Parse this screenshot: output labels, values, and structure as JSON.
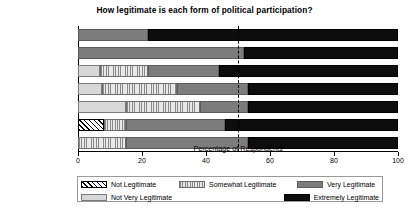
{
  "chart_data": {
    "type": "bar",
    "orientation": "horizontal",
    "stacked": true,
    "title": "How legitimate is each form of political participation?",
    "xlabel": "Percentage of Respondents",
    "ylabel": "",
    "xlim": [
      0,
      100
    ],
    "xticks": [
      0,
      20,
      40,
      60,
      80,
      100
    ],
    "grid": false,
    "legend_position": "bottom",
    "reference_line": {
      "value": 50,
      "style": "dashed",
      "color": "#000000"
    },
    "categories": [
      "Voting",
      "Volunteering",
      "Contacting Elected Officials",
      "Protesting",
      "Lobbying",
      "Running for Office",
      "Voicing Opinions"
    ],
    "category_lines": [
      [
        "Voting"
      ],
      [
        "Volunteering"
      ],
      [
        "Contacting Elected",
        "Officials"
      ],
      [
        "Protesting"
      ],
      [
        "Lobbying"
      ],
      [
        "Running for Office"
      ],
      [
        "Voicing Opinions"
      ]
    ],
    "series": [
      {
        "name": "Not Legitimate",
        "pattern": "diagonal-hatch",
        "color": "#ffffff",
        "values": [
          0,
          0,
          0,
          0,
          0,
          8,
          0
        ]
      },
      {
        "name": "Not Very Legitimate",
        "pattern": "solid-light-gray",
        "color": "#d8d8d8",
        "values": [
          0,
          0,
          7,
          7.5,
          15,
          0,
          0
        ]
      },
      {
        "name": "Somewhat Legitimate",
        "pattern": "vertical-stripe",
        "color": "#e2e2e2",
        "values": [
          0,
          0,
          15,
          23.5,
          23,
          7,
          15
        ]
      },
      {
        "name": "Very Legitimate",
        "pattern": "solid-mid-gray",
        "color": "#7c7c7c",
        "values": [
          22,
          52,
          22,
          22,
          15,
          31,
          38
        ]
      },
      {
        "name": "Extremely Legitimate",
        "pattern": "solid-black",
        "color": "#0d0d0d",
        "values": [
          78,
          48,
          56,
          47,
          47,
          54,
          47
        ]
      }
    ]
  },
  "legend": {
    "entries": [
      {
        "label": "Not Legitimate"
      },
      {
        "label": "Somewhat Legitimate"
      },
      {
        "label": "Very Legitimate"
      },
      {
        "label": "Not Very Legitimate"
      },
      {
        "label": "Extremely Legitimate"
      }
    ]
  }
}
